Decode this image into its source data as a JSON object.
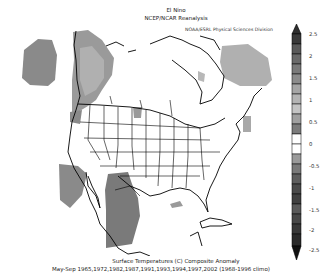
{
  "header": {
    "title_line1": "El Nino",
    "title_line2": "NCEP/NCAR Reanalysis",
    "credit": "NOAA/ESRL Physical Sciences Division"
  },
  "footer": {
    "caption_line1": "Surface Temperatures (C) Composite Anomaly",
    "caption_line2": "May-Sep 1965,1972,1982,1987,1991,1993,1994,1997,2002 (1968-1996 climo)"
  },
  "colorbar": {
    "labels": [
      "2.5",
      "2",
      "1.5",
      "1",
      "0.5",
      "0",
      "-0.5",
      "-1",
      "-1.5",
      "-2",
      "-2.5"
    ],
    "min": -2.5,
    "max": 2.5,
    "step": 0.5,
    "extend": "both",
    "colors": {
      "pos_2_5_plus": "#3a3a3a",
      "pos_2_0": "#6a6a6a",
      "pos_1_5": "#8c8c8c",
      "pos_1_0": "#b4b4b4",
      "pos_0_5": "#cfcfcf",
      "neutral": "#ffffff",
      "neg_0_5": "#9a9a9a",
      "neg_1_0": "#6e6e6e",
      "neg_1_5": "#555555",
      "neg_2_0": "#3f3f3f",
      "neg_2_5": "#2a2a2a"
    }
  },
  "map": {
    "region": "North America",
    "projection": "polar stereographic",
    "anomaly_regions": [
      {
        "name": "Gulf of Alaska / NE Pacific",
        "sign": "negative",
        "approx_value": -0.75
      },
      {
        "name": "Alaska / Yukon",
        "sign": "negative",
        "approx_value": -1.0
      },
      {
        "name": "Quebec / Labrador / NE Canada",
        "sign": "positive",
        "approx_value": 0.75
      },
      {
        "name": "Baja California offshore",
        "sign": "negative",
        "approx_value": -0.75
      },
      {
        "name": "Northern Mexico (Sierra Madre)",
        "sign": "negative",
        "approx_value": -1.0
      },
      {
        "name": "Gulf of Mexico small patch",
        "sign": "negative",
        "approx_value": -0.5
      },
      {
        "name": "Western Atlantic patch",
        "sign": "positive",
        "approx_value": 0.5
      },
      {
        "name": "North Dakota / Saskatchewan border",
        "sign": "negative",
        "approx_value": -0.5
      },
      {
        "name": "Hudson Bay west coast",
        "sign": "positive",
        "approx_value": 0.5
      }
    ]
  }
}
